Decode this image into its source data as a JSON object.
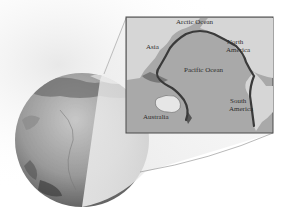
{
  "figure": {
    "colors": {
      "background": "#ffffff",
      "ocean": "#a9a9a9",
      "land": "#d6d6d6",
      "ring": "#3a3a3a",
      "frame": "#4a4a4a",
      "globe_dark": "#555555",
      "globe_light": "#bdbdbd"
    }
  },
  "map": {
    "labels": {
      "arctic_ocean": "Arctic Ocean",
      "asia": "Asia",
      "north_america_1": "North",
      "north_america_2": "America",
      "pacific_ocean": "Pacific Ocean",
      "south_america_1": "South",
      "south_america_2": "America",
      "australia": "Australia"
    }
  }
}
